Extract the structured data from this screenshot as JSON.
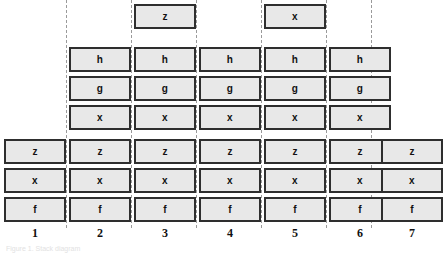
{
  "figure": {
    "type": "stacked-box-column-diagram",
    "column_count": 7,
    "colors": {
      "box_fill": "#e8e8e8",
      "box_border": "#2e2e2e",
      "divider": "#9a9a9a",
      "text": "#111111",
      "background": "#ffffff"
    },
    "caption_fragment": "Figure 1. Stack diagram"
  },
  "columns": [
    {
      "label": "1",
      "top": [],
      "middle": [],
      "bottom": [
        "z",
        "x",
        "f"
      ]
    },
    {
      "label": "2",
      "top": [],
      "middle": [
        "h",
        "g",
        "x"
      ],
      "bottom": [
        "z",
        "x",
        "f"
      ]
    },
    {
      "label": "3",
      "top": [
        "z"
      ],
      "middle": [
        "h",
        "g",
        "x"
      ],
      "bottom": [
        "z",
        "x",
        "f"
      ]
    },
    {
      "label": "4",
      "top": [],
      "middle": [
        "h",
        "g",
        "x"
      ],
      "bottom": [
        "z",
        "x",
        "f"
      ]
    },
    {
      "label": "5",
      "top": [
        "x"
      ],
      "middle": [
        "h",
        "g",
        "x"
      ],
      "bottom": [
        "z",
        "x",
        "f"
      ]
    },
    {
      "label": "6",
      "top": [],
      "middle": [
        "h",
        "g",
        "x"
      ],
      "bottom": [
        "z",
        "x",
        "f"
      ]
    },
    {
      "label": "7",
      "top": [],
      "middle": [],
      "bottom": [
        "z",
        "x",
        "f"
      ]
    }
  ],
  "layout": {
    "column_left_positions": [
      4,
      69,
      134,
      199,
      264,
      329,
      381
    ],
    "divider_positions": [
      66,
      131,
      196,
      261,
      326,
      371
    ]
  }
}
